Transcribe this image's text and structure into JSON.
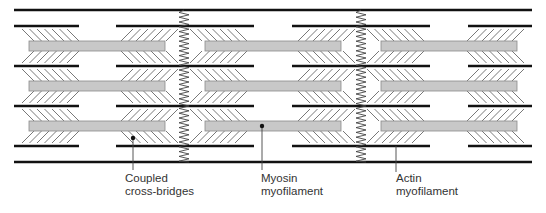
{
  "diagram": {
    "colors": {
      "line": "#111111",
      "myosin_fill": "#c8c8c8",
      "myosin_stroke": "#8a8a8a",
      "crossbridge": "#555555",
      "zdisc": "#444444",
      "label_text": "#333333",
      "pointer": "#444444"
    },
    "sarcomeres": 3,
    "myosin_rows": 3,
    "labels": [
      {
        "id": "coupled-cross-bridges",
        "lines": [
          "Coupled",
          "cross-bridges"
        ],
        "pointer_has_dot": true
      },
      {
        "id": "myosin-myofilament",
        "lines": [
          "Myosin",
          "myofilament"
        ],
        "pointer_has_dot": true
      },
      {
        "id": "actin-myofilament",
        "lines": [
          "Actin",
          "myofilament"
        ],
        "pointer_has_dot": false
      }
    ]
  }
}
